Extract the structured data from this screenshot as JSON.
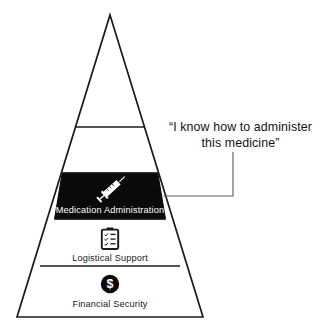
{
  "diagram": {
    "type": "pyramid-hierarchy",
    "title_visible": false,
    "tiers": [
      {
        "id": "tier-top-blank-1",
        "label": "",
        "icon": "",
        "highlighted": false
      },
      {
        "id": "tier-top-blank-2",
        "label": "",
        "icon": "",
        "highlighted": false
      },
      {
        "id": "tier-medication-administration",
        "label": "Medication Administration",
        "icon": "syringe-icon",
        "highlighted": true
      },
      {
        "id": "tier-logistical-support",
        "label": "Logistical Support",
        "icon": "clipboard-checklist-icon",
        "highlighted": false
      },
      {
        "id": "tier-financial-security",
        "label": "Financial Security",
        "icon": "dollar-circle-icon",
        "highlighted": false
      }
    ],
    "callout": {
      "line1": "“I know how to administer",
      "line2": "this medicine”",
      "points_to": "tier-medication-administration"
    },
    "colors": {
      "stroke": "#1a1a1a",
      "highlight_fill": "#0a0a0a",
      "background": "#ffffff",
      "label_dark": "#1a1a1a",
      "label_light": "#ffffff",
      "leader_line": "#4a4a4a"
    }
  }
}
